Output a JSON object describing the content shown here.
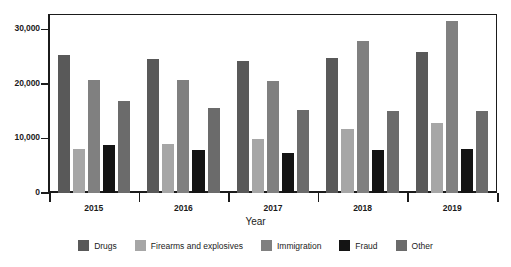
{
  "chart_data": {
    "type": "bar",
    "title": "",
    "xlabel": "Year",
    "ylabel": "",
    "categories": [
      "2015",
      "2016",
      "2017",
      "2018",
      "2019"
    ],
    "series": [
      {
        "name": "Drugs",
        "color": "#595959",
        "values": [
          25300,
          24600,
          24200,
          24700,
          25800
        ]
      },
      {
        "name": "Firearms and explosives",
        "color": "#a6a6a6",
        "values": [
          8000,
          8900,
          9900,
          11700,
          12800
        ]
      },
      {
        "name": "Immigration",
        "color": "#808080",
        "values": [
          20700,
          20800,
          20500,
          27900,
          31500
        ]
      },
      {
        "name": "Fraud",
        "color": "#141414",
        "values": [
          8800,
          7900,
          7300,
          7900,
          8000
        ]
      },
      {
        "name": "Other",
        "color": "#6b6b6b",
        "values": [
          16800,
          15600,
          15300,
          15100,
          15100
        ]
      }
    ],
    "ylim": [
      0,
      32800
    ],
    "yticks": [
      0,
      10000,
      20000,
      30000
    ],
    "ytick_labels": [
      "0",
      "10,000",
      "20,000",
      "30,000"
    ],
    "grid": false,
    "legend_position": "bottom",
    "axis_color": "#1b1b1b"
  },
  "legend": {
    "entries": [
      {
        "label": "Drugs",
        "color": "#595959"
      },
      {
        "label": "Firearms and explosives",
        "color": "#a6a6a6"
      },
      {
        "label": "Immigration",
        "color": "#808080"
      },
      {
        "label": "Fraud",
        "color": "#141414"
      },
      {
        "label": "Other",
        "color": "#6b6b6b"
      }
    ]
  }
}
